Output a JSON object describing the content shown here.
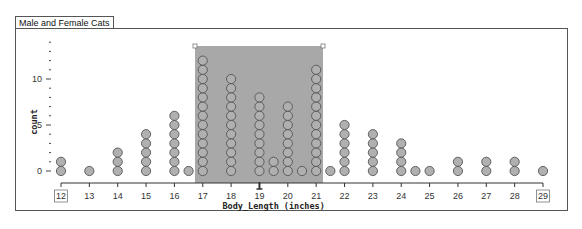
{
  "window": {
    "tab_title": "Male and Female Cats"
  },
  "chart_data": {
    "type": "dotplot",
    "title": "Male and Female Cats",
    "xlabel": "Body_Length (inches)",
    "ylabel": "count",
    "xlim": [
      12,
      29
    ],
    "ylim": [
      0,
      14
    ],
    "x_ticks": [
      12,
      13,
      14,
      15,
      16,
      17,
      18,
      19,
      20,
      21,
      22,
      23,
      24,
      25,
      26,
      27,
      28,
      29
    ],
    "y_ticks": [
      0,
      5,
      10
    ],
    "boxed_tick_labels": [
      12,
      29
    ],
    "points": [
      {
        "x": 12,
        "count": 2
      },
      {
        "x": 13,
        "count": 1
      },
      {
        "x": 14,
        "count": 3
      },
      {
        "x": 15,
        "count": 5
      },
      {
        "x": 16,
        "count": 7
      },
      {
        "x": 16.5,
        "count": 1
      },
      {
        "x": 17,
        "count": 13
      },
      {
        "x": 18,
        "count": 11
      },
      {
        "x": 19,
        "count": 9
      },
      {
        "x": 19.5,
        "count": 2
      },
      {
        "x": 20,
        "count": 8
      },
      {
        "x": 20.5,
        "count": 1
      },
      {
        "x": 21,
        "count": 12
      },
      {
        "x": 21.5,
        "count": 1
      },
      {
        "x": 22,
        "count": 6
      },
      {
        "x": 23,
        "count": 5
      },
      {
        "x": 24,
        "count": 4
      },
      {
        "x": 24.5,
        "count": 1
      },
      {
        "x": 25,
        "count": 1
      },
      {
        "x": 26,
        "count": 2
      },
      {
        "x": 27,
        "count": 2
      },
      {
        "x": 28,
        "count": 2
      },
      {
        "x": 29,
        "count": 1
      }
    ],
    "selection": {
      "x_from": 16.75,
      "x_to": 21.25,
      "color": "#a8a8a8"
    },
    "marker_at_x": 19,
    "dot_color": "#b0b0b0",
    "dot_stroke": "#555555",
    "grid": false,
    "legend": null
  }
}
